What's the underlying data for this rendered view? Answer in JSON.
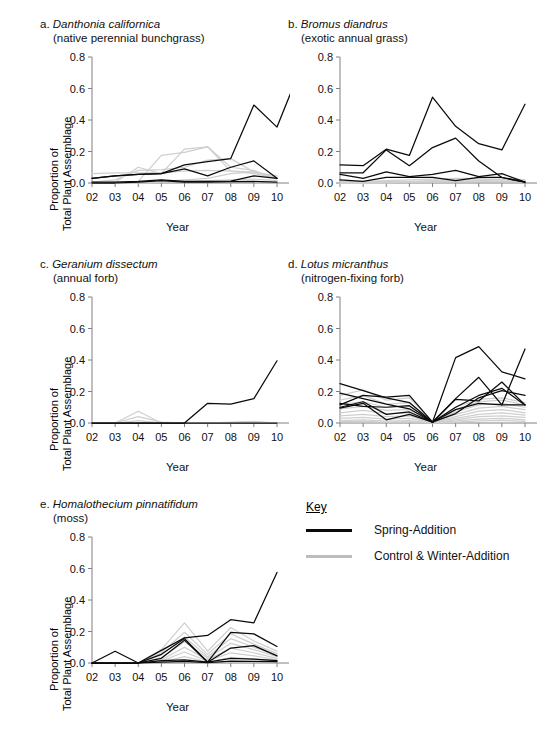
{
  "figure": {
    "background": "#ffffff",
    "spring_color": "#0a0a0a",
    "control_color": "#cfcfcf",
    "axis_color": "#808080"
  },
  "legend": {
    "title": "Key",
    "items": [
      {
        "label": "Spring-Addition",
        "color": "#0a0a0a",
        "name": "spring-addition"
      },
      {
        "label": "Control & Winter-Addition",
        "color": "#bdbdbd",
        "name": "control-winter-addition"
      }
    ]
  },
  "axes_common": {
    "xlabel": "Year",
    "ylabel_line1": "Proportion of",
    "ylabel_line2": "Total Plant Assemblage",
    "categories": [
      "02",
      "03",
      "04",
      "05",
      "06",
      "07",
      "08",
      "09",
      "10"
    ],
    "yticks": [
      "0.0",
      "0.2",
      "0.4",
      "0.6",
      "0.8"
    ],
    "ylim": [
      0,
      0.8
    ]
  },
  "chart_data": [
    {
      "id": "a",
      "type": "line",
      "panel_letter": "a.",
      "title": "Danthonia californica",
      "subtitle": "(native perennial bunchgrass)",
      "xlabel": "Year",
      "ylabel": "Proportion of Total Plant Assemblage",
      "x": [
        "02",
        "03",
        "04",
        "05",
        "06",
        "07",
        "08",
        "09",
        "10"
      ],
      "ylim": [
        0,
        0.8
      ],
      "yticks": [
        0.0,
        0.2,
        0.4,
        0.6,
        0.8
      ],
      "grid": false,
      "legend_position": "external",
      "series": [
        {
          "name": "Spring-Addition 1",
          "group": "spring",
          "values": [
            0.03,
            0.045,
            0.055,
            0.06,
            0.115,
            0.135,
            0.155,
            0.495,
            0.355,
            0.72
          ]
        },
        {
          "name": "Spring-Addition 2",
          "group": "spring",
          "values": [
            0.03,
            0.045,
            0.055,
            0.06,
            0.09,
            0.045,
            0.1,
            0.14,
            0.03
          ]
        },
        {
          "name": "Spring-Addition 3",
          "group": "spring",
          "values": [
            0.005,
            0.005,
            0.01,
            0.02,
            0.01,
            0.01,
            0.012,
            0.045,
            0.03
          ]
        },
        {
          "name": "Spring-Addition 4",
          "group": "spring",
          "values": [
            0.0,
            0.0,
            0.005,
            0.015,
            0.005,
            0.005,
            0.008,
            0.01,
            0.005
          ]
        },
        {
          "name": "Control 1",
          "group": "control",
          "values": [
            0.06,
            0.065,
            0.065,
            0.065,
            0.075,
            0.08,
            0.075,
            0.07,
            0.03
          ]
        },
        {
          "name": "Control 2",
          "group": "control",
          "values": [
            0.005,
            0.02,
            0.08,
            0.085,
            0.1,
            0.145,
            0.155,
            0.07,
            0.035
          ]
        },
        {
          "name": "Control 3",
          "group": "control",
          "values": [
            0.0,
            0.005,
            0.1,
            0.06,
            0.215,
            0.23,
            0.075,
            0.06,
            0.03
          ]
        },
        {
          "name": "Control 4",
          "group": "control",
          "values": [
            0.0,
            0.005,
            0.01,
            0.175,
            0.195,
            0.23,
            0.1,
            0.08,
            0.025
          ]
        },
        {
          "name": "Control 5",
          "group": "control",
          "values": [
            0.0,
            0.0,
            0.005,
            0.01,
            0.02,
            0.03,
            0.06,
            0.07,
            0.045
          ]
        },
        {
          "name": "Control 6",
          "group": "control",
          "values": [
            0.0,
            0.0,
            0.0,
            0.005,
            0.01,
            0.015,
            0.02,
            0.025,
            0.015
          ]
        }
      ]
    },
    {
      "id": "b",
      "type": "line",
      "panel_letter": "b.",
      "title": "Bromus diandrus",
      "subtitle": "(exotic annual grass)",
      "xlabel": "Year",
      "ylabel": "",
      "x": [
        "02",
        "03",
        "04",
        "05",
        "06",
        "07",
        "08",
        "09",
        "10"
      ],
      "ylim": [
        0,
        0.8
      ],
      "yticks": [
        0.0,
        0.2,
        0.4,
        0.6,
        0.8
      ],
      "grid": false,
      "legend_position": "external",
      "series": [
        {
          "name": "Spring-Addition 1",
          "group": "spring",
          "values": [
            0.115,
            0.11,
            0.215,
            0.175,
            0.545,
            0.36,
            0.25,
            0.21,
            0.5
          ]
        },
        {
          "name": "Spring-Addition 2",
          "group": "spring",
          "values": [
            0.065,
            0.065,
            0.21,
            0.11,
            0.225,
            0.285,
            0.14,
            0.035,
            0.005
          ]
        },
        {
          "name": "Spring-Addition 3",
          "group": "spring",
          "values": [
            0.055,
            0.03,
            0.07,
            0.04,
            0.055,
            0.08,
            0.04,
            0.06,
            0.005
          ]
        },
        {
          "name": "Spring-Addition 4",
          "group": "spring",
          "values": [
            0.02,
            0.01,
            0.035,
            0.035,
            0.035,
            0.015,
            0.035,
            0.035,
            0.005
          ]
        },
        {
          "name": "Control 1",
          "group": "control",
          "values": [
            0.01,
            0.01,
            0.015,
            0.02,
            0.025,
            0.03,
            0.03,
            0.035,
            0.02
          ]
        },
        {
          "name": "Control 2",
          "group": "control",
          "values": [
            0.005,
            0.005,
            0.01,
            0.01,
            0.015,
            0.02,
            0.02,
            0.025,
            0.015
          ]
        },
        {
          "name": "Control 3",
          "group": "control",
          "values": [
            0.0,
            0.0,
            0.005,
            0.005,
            0.01,
            0.01,
            0.015,
            0.02,
            0.01
          ]
        },
        {
          "name": "Control 4",
          "group": "control",
          "values": [
            0.0,
            0.0,
            0.0,
            0.005,
            0.005,
            0.008,
            0.01,
            0.012,
            0.008
          ]
        }
      ]
    },
    {
      "id": "c",
      "type": "line",
      "panel_letter": "c.",
      "title": "Geranium dissectum",
      "subtitle": "(annual forb)",
      "xlabel": "Year",
      "ylabel": "Proportion of Total Plant Assemblage",
      "x": [
        "02",
        "03",
        "04",
        "05",
        "06",
        "07",
        "08",
        "09",
        "10"
      ],
      "ylim": [
        0,
        0.8
      ],
      "yticks": [
        0.0,
        0.2,
        0.4,
        0.6,
        0.8
      ],
      "grid": false,
      "legend_position": "external",
      "series": [
        {
          "name": "Spring-Addition 1",
          "group": "spring",
          "values": [
            0.0,
            0.0,
            0.0,
            0.0,
            0.0,
            0.125,
            0.12,
            0.155,
            0.395
          ]
        },
        {
          "name": "Spring-Addition 2",
          "group": "spring",
          "values": [
            0.0,
            0.0,
            0.0,
            0.0,
            0.0,
            0.0,
            0.0,
            0.0,
            0.0
          ]
        },
        {
          "name": "Control 1",
          "group": "control",
          "values": [
            0.0,
            0.0,
            0.075,
            0.0,
            0.0,
            0.0,
            0.005,
            0.01,
            0.0
          ]
        },
        {
          "name": "Control 2",
          "group": "control",
          "values": [
            0.0,
            0.0,
            0.04,
            0.005,
            0.0,
            0.0,
            0.002,
            0.004,
            0.0
          ]
        },
        {
          "name": "Control 3",
          "group": "control",
          "values": [
            0.0,
            0.0,
            0.015,
            0.0,
            0.0,
            0.0,
            0.0,
            0.002,
            0.0
          ]
        }
      ]
    },
    {
      "id": "d",
      "type": "line",
      "panel_letter": "d.",
      "title": "Lotus micranthus",
      "subtitle": "(nitrogen-fixing forb)",
      "xlabel": "Year",
      "ylabel": "",
      "x": [
        "02",
        "03",
        "04",
        "05",
        "06",
        "07",
        "08",
        "09",
        "10"
      ],
      "ylim": [
        0,
        0.8
      ],
      "yticks": [
        0.0,
        0.2,
        0.4,
        0.6,
        0.8
      ],
      "grid": false,
      "legend_position": "external",
      "series": [
        {
          "name": "Spring-Addition 1",
          "group": "spring",
          "values": [
            0.25,
            0.205,
            0.16,
            0.13,
            0.005,
            0.415,
            0.485,
            0.325,
            0.28
          ]
        },
        {
          "name": "Spring-Addition 2",
          "group": "spring",
          "values": [
            0.19,
            0.155,
            0.12,
            0.09,
            0.005,
            0.155,
            0.29,
            0.115,
            0.47
          ]
        },
        {
          "name": "Spring-Addition 3",
          "group": "spring",
          "values": [
            0.115,
            0.175,
            0.165,
            0.175,
            0.005,
            0.15,
            0.14,
            0.26,
            0.115
          ]
        },
        {
          "name": "Spring-Addition 4",
          "group": "spring",
          "values": [
            0.095,
            0.125,
            0.02,
            0.055,
            0.005,
            0.1,
            0.175,
            0.22,
            0.115
          ]
        },
        {
          "name": "Spring-Addition 5",
          "group": "spring",
          "values": [
            0.1,
            0.135,
            0.055,
            0.07,
            0.005,
            0.06,
            0.16,
            0.205,
            0.175
          ]
        },
        {
          "name": "Spring-Addition 6",
          "group": "spring",
          "values": [
            0.125,
            0.105,
            0.1,
            0.11,
            0.005,
            0.085,
            0.125,
            0.115,
            0.115
          ]
        },
        {
          "name": "Control 1",
          "group": "control",
          "values": [
            0.175,
            0.21,
            0.145,
            0.16,
            0.01,
            0.1,
            0.15,
            0.16,
            0.13
          ]
        },
        {
          "name": "Control 2",
          "group": "control",
          "values": [
            0.145,
            0.175,
            0.12,
            0.13,
            0.01,
            0.085,
            0.135,
            0.145,
            0.115
          ]
        },
        {
          "name": "Control 3",
          "group": "control",
          "values": [
            0.115,
            0.135,
            0.1,
            0.105,
            0.008,
            0.07,
            0.115,
            0.125,
            0.1
          ]
        },
        {
          "name": "Control 4",
          "group": "control",
          "values": [
            0.09,
            0.105,
            0.08,
            0.085,
            0.006,
            0.055,
            0.095,
            0.105,
            0.085
          ]
        },
        {
          "name": "Control 5",
          "group": "control",
          "values": [
            0.065,
            0.08,
            0.06,
            0.065,
            0.005,
            0.04,
            0.075,
            0.085,
            0.065
          ]
        },
        {
          "name": "Control 6",
          "group": "control",
          "values": [
            0.045,
            0.055,
            0.04,
            0.045,
            0.004,
            0.03,
            0.055,
            0.065,
            0.05
          ]
        },
        {
          "name": "Control 7",
          "group": "control",
          "values": [
            0.03,
            0.035,
            0.025,
            0.03,
            0.003,
            0.02,
            0.04,
            0.045,
            0.035
          ]
        },
        {
          "name": "Control 8",
          "group": "control",
          "values": [
            0.015,
            0.02,
            0.012,
            0.015,
            0.002,
            0.012,
            0.025,
            0.03,
            0.02
          ]
        },
        {
          "name": "Control 9",
          "group": "control",
          "values": [
            0.008,
            0.01,
            0.006,
            0.008,
            0.001,
            0.006,
            0.014,
            0.016,
            0.01
          ]
        }
      ]
    },
    {
      "id": "e",
      "type": "line",
      "panel_letter": "e.",
      "title": "Homalothecium pinnatifidum",
      "subtitle": "(moss)",
      "xlabel": "Year",
      "ylabel": "Proportion of Total Plant Assemblage",
      "x": [
        "02",
        "03",
        "04",
        "05",
        "06",
        "07",
        "08",
        "09",
        "10"
      ],
      "ylim": [
        0,
        0.8
      ],
      "yticks": [
        0.0,
        0.2,
        0.4,
        0.6,
        0.8
      ],
      "grid": false,
      "legend_position": "external",
      "series": [
        {
          "name": "Spring-Addition 1",
          "group": "spring",
          "values": [
            0.0,
            0.075,
            0.0,
            0.08,
            0.16,
            0.175,
            0.275,
            0.255,
            0.575
          ]
        },
        {
          "name": "Spring-Addition 2",
          "group": "spring",
          "values": [
            0.0,
            0.0,
            0.0,
            0.055,
            0.155,
            0.005,
            0.195,
            0.185,
            0.105
          ]
        },
        {
          "name": "Spring-Addition 3",
          "group": "spring",
          "values": [
            0.0,
            0.0,
            0.0,
            0.03,
            0.145,
            0.005,
            0.095,
            0.11,
            0.045
          ]
        },
        {
          "name": "Spring-Addition 4",
          "group": "spring",
          "values": [
            0.0,
            0.0,
            0.0,
            0.015,
            0.02,
            0.005,
            0.03,
            0.025,
            0.015
          ]
        },
        {
          "name": "Spring-Addition 5",
          "group": "spring",
          "values": [
            0.0,
            0.0,
            0.0,
            0.005,
            0.01,
            0.002,
            0.012,
            0.01,
            0.008
          ]
        },
        {
          "name": "Control 1",
          "group": "control",
          "values": [
            0.0,
            0.0,
            0.0,
            0.085,
            0.255,
            0.075,
            0.225,
            0.14,
            0.075
          ]
        },
        {
          "name": "Control 2",
          "group": "control",
          "values": [
            0.0,
            0.0,
            0.0,
            0.065,
            0.195,
            0.055,
            0.185,
            0.12,
            0.06
          ]
        },
        {
          "name": "Control 3",
          "group": "control",
          "values": [
            0.0,
            0.0,
            0.0,
            0.05,
            0.165,
            0.04,
            0.155,
            0.1,
            0.05
          ]
        },
        {
          "name": "Control 4",
          "group": "control",
          "values": [
            0.0,
            0.0,
            0.0,
            0.035,
            0.135,
            0.03,
            0.125,
            0.085,
            0.04
          ]
        },
        {
          "name": "Control 5",
          "group": "control",
          "values": [
            0.0,
            0.0,
            0.0,
            0.02,
            0.1,
            0.02,
            0.095,
            0.065,
            0.03
          ]
        },
        {
          "name": "Control 6",
          "group": "control",
          "values": [
            0.0,
            0.0,
            0.0,
            0.012,
            0.07,
            0.012,
            0.065,
            0.045,
            0.02
          ]
        },
        {
          "name": "Control 7",
          "group": "control",
          "values": [
            0.0,
            0.0,
            0.0,
            0.006,
            0.04,
            0.006,
            0.035,
            0.025,
            0.012
          ]
        }
      ]
    }
  ]
}
